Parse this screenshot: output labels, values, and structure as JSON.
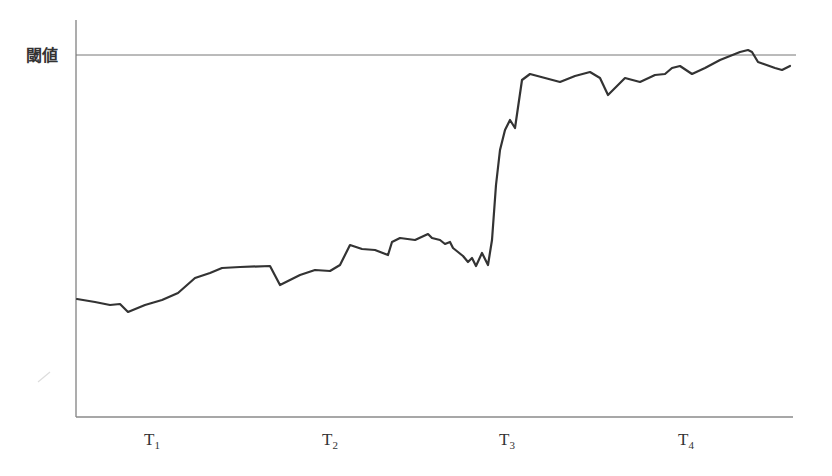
{
  "chart_data": {
    "type": "line",
    "title": "",
    "xlabel": "",
    "ylabel": "",
    "y_reference_line": {
      "label": "閾値",
      "description": "threshold"
    },
    "x_ticks": [
      {
        "main": "T",
        "sub": "1"
      },
      {
        "main": "T",
        "sub": "2"
      },
      {
        "main": "T",
        "sub": "3"
      },
      {
        "main": "T",
        "sub": "4"
      }
    ],
    "grid": false,
    "legend": null,
    "series": [
      {
        "name": "signal",
        "color": "#333333",
        "description": "Rises gradually from T1 to just before T3, jumps sharply near T3, then plateaus just below the threshold and briefly crosses it between T4 and the end",
        "points": [
          [
            77,
            299
          ],
          [
            95,
            302
          ],
          [
            110,
            305
          ],
          [
            120,
            304
          ],
          [
            128,
            312
          ],
          [
            145,
            305
          ],
          [
            162,
            300
          ],
          [
            178,
            293
          ],
          [
            195,
            278
          ],
          [
            210,
            273
          ],
          [
            222,
            268
          ],
          [
            240,
            267
          ],
          [
            270,
            266
          ],
          [
            280,
            285
          ],
          [
            300,
            275
          ],
          [
            315,
            270
          ],
          [
            330,
            271
          ],
          [
            340,
            265
          ],
          [
            350,
            245
          ],
          [
            362,
            249
          ],
          [
            375,
            250
          ],
          [
            388,
            255
          ],
          [
            392,
            242
          ],
          [
            400,
            238
          ],
          [
            415,
            240
          ],
          [
            428,
            234
          ],
          [
            432,
            238
          ],
          [
            440,
            240
          ],
          [
            445,
            244
          ],
          [
            450,
            242
          ],
          [
            453,
            248
          ],
          [
            458,
            252
          ],
          [
            463,
            256
          ],
          [
            468,
            262
          ],
          [
            472,
            258
          ],
          [
            476,
            266
          ],
          [
            482,
            253
          ],
          [
            488,
            265
          ],
          [
            492,
            240
          ],
          [
            496,
            185
          ],
          [
            500,
            150
          ],
          [
            505,
            130
          ],
          [
            510,
            120
          ],
          [
            515,
            128
          ],
          [
            522,
            80
          ],
          [
            530,
            74
          ],
          [
            545,
            78
          ],
          [
            560,
            82
          ],
          [
            575,
            76
          ],
          [
            590,
            72
          ],
          [
            600,
            78
          ],
          [
            608,
            95
          ],
          [
            615,
            88
          ],
          [
            625,
            78
          ],
          [
            640,
            82
          ],
          [
            655,
            75
          ],
          [
            665,
            74
          ],
          [
            672,
            68
          ],
          [
            680,
            66
          ],
          [
            692,
            74
          ],
          [
            705,
            68
          ],
          [
            720,
            60
          ],
          [
            740,
            52
          ],
          [
            748,
            50
          ],
          [
            752,
            52
          ],
          [
            758,
            62
          ],
          [
            775,
            68
          ],
          [
            782,
            70
          ],
          [
            790,
            66
          ]
        ]
      }
    ],
    "axis_geometry": {
      "x0": 76,
      "y_top": 20,
      "y_bottom": 417,
      "x_end": 793,
      "threshold_y": 55,
      "tick_x": [
        152,
        330,
        507,
        686
      ]
    }
  }
}
